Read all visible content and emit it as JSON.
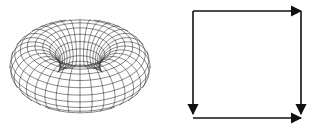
{
  "diagram": {
    "type": "torus-fundamental-polygon",
    "panels": [
      {
        "id": "torus",
        "description": "wireframe torus surface"
      },
      {
        "id": "square",
        "description": "fundamental square with directed edges"
      }
    ],
    "torus": {
      "center": [
        80,
        66
      ],
      "major_radius": 45,
      "minor_radius": 25,
      "stroke": "#222222",
      "u_lines": 36,
      "v_lines": 20
    },
    "square": {
      "x0": 32,
      "y0": 11,
      "x1": 140,
      "y1": 118,
      "stroke": "#111111",
      "edges": [
        {
          "name": "top",
          "direction": "right"
        },
        {
          "name": "bottom",
          "direction": "right"
        },
        {
          "name": "left",
          "direction": "down"
        },
        {
          "name": "right",
          "direction": "down"
        }
      ]
    }
  }
}
